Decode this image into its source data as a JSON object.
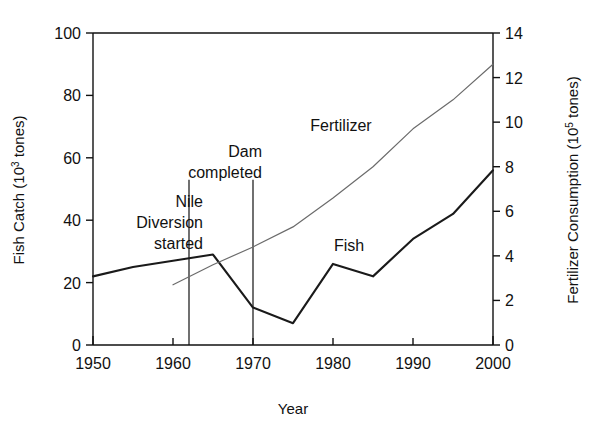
{
  "chart_data": {
    "type": "line",
    "title": "",
    "xlabel": "Year",
    "ylabel_left": "Fish Catch (10",
    "ylabel_left_sup": "3",
    "ylabel_left_tail": " tones)",
    "ylabel_right": "Fertilizer Consumption (10",
    "ylabel_right_sup": "5",
    "ylabel_right_tail": " tones)",
    "xlim": [
      1950,
      2000
    ],
    "ylim_left": [
      0,
      100
    ],
    "ylim_right": [
      0,
      14
    ],
    "grid": false,
    "legend_position": "inline-labels",
    "x_ticks": [
      1950,
      1960,
      1970,
      1980,
      1990,
      2000
    ],
    "x_tick_labels": [
      "1950",
      "1960",
      "1970",
      "1980",
      "1990",
      "2000"
    ],
    "y_ticks_left": [
      0,
      20,
      40,
      60,
      80,
      100
    ],
    "y_tick_labels_left": [
      "0",
      "20",
      "40",
      "60",
      "80",
      "100"
    ],
    "y_ticks_right": [
      0,
      2,
      4,
      6,
      8,
      10,
      12,
      14
    ],
    "y_tick_labels_right": [
      "0",
      "2",
      "4",
      "6",
      "8",
      "10",
      "12",
      "14"
    ],
    "series": [
      {
        "name": "Fish",
        "axis": "left",
        "unit": "10^3 tones",
        "stroke": "#1a1a1a",
        "stroke_width": 2.1,
        "label": "Fish",
        "label_x": 1982,
        "label_y_left": 30,
        "x": [
          1950,
          1955,
          1960,
          1965,
          1970,
          1975,
          1980,
          1985,
          1990,
          1995,
          2000
        ],
        "values": [
          22,
          25,
          27,
          29,
          12,
          7,
          26,
          22,
          34,
          42,
          56
        ]
      },
      {
        "name": "Fertilizer",
        "axis": "right",
        "unit": "10^5 tones",
        "stroke": "#6b6b6b",
        "stroke_width": 1.2,
        "label": "Fertilizer",
        "label_x": 1981,
        "label_y_right": 9.6,
        "x": [
          1960,
          1965,
          1970,
          1975,
          1980,
          1985,
          1990,
          1995,
          2000
        ],
        "values": [
          2.7,
          3.6,
          4.4,
          5.3,
          6.6,
          8.0,
          9.7,
          11.0,
          12.6
        ]
      }
    ],
    "annotations": [
      {
        "id": "nile-diversion",
        "lines": [
          "Nile",
          "Diversion",
          "started"
        ],
        "text": "Nile Diversion started",
        "marker_year": 1962,
        "marker_top_left_value": 53,
        "marker_bottom_left_value": 0
      },
      {
        "id": "dam-completed",
        "lines": [
          "Dam",
          "completed"
        ],
        "text": "Dam completed",
        "marker_year": 1970,
        "marker_top_left_value": 53,
        "marker_bottom_left_value": 0
      }
    ]
  }
}
